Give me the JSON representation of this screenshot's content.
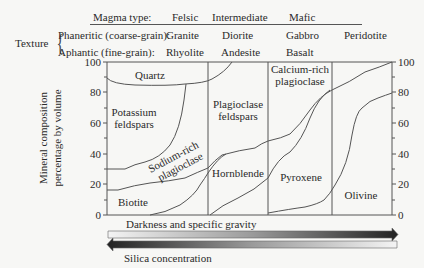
{
  "header": {
    "magma_type_label": "Magma type:",
    "magma_types": [
      "Felsic",
      "Intermediate",
      "Mafic"
    ],
    "texture_label": "Texture",
    "phaneritic_label": "Phaneritic (coarse-grain):",
    "aphantic_label": "Aphantic (fine-grain):",
    "phaneritic_rocks": [
      "Granite",
      "Diorite",
      "Gabbro",
      "Peridotite"
    ],
    "aphantic_rocks": [
      "Rhyolite",
      "Andesite",
      "Basalt"
    ]
  },
  "axis": {
    "y_label_line1": "Mineral composition",
    "y_label_line2": "percentage by volume",
    "left_ticks": [
      "100",
      "80",
      "60",
      "40",
      "20",
      "0"
    ],
    "right_ticks": [
      "100",
      "80",
      "60",
      "40",
      "20",
      "0"
    ]
  },
  "minerals": {
    "quartz": "Quartz",
    "potassium_1": "Potassium",
    "potassium_2": "feldspars",
    "sodium_1": "Sodium-rich",
    "sodium_2": "plagioclase",
    "biotite": "Biotite",
    "plagioclase_1": "Plagioclase",
    "plagioclase_2": "feldspars",
    "hornblende": "Hornblende",
    "calcium_1": "Calcium-rich",
    "calcium_2": "plagioclase",
    "pyroxene": "Pyroxene",
    "olivine": "Olivine"
  },
  "arrows": {
    "darkness": "Darkness and specific gravity",
    "silica": "Silica concentration"
  },
  "colors": {
    "line": "#555555",
    "arrow_dark": "#2a2a2a",
    "arrow_light": "#f2f2f2"
  }
}
